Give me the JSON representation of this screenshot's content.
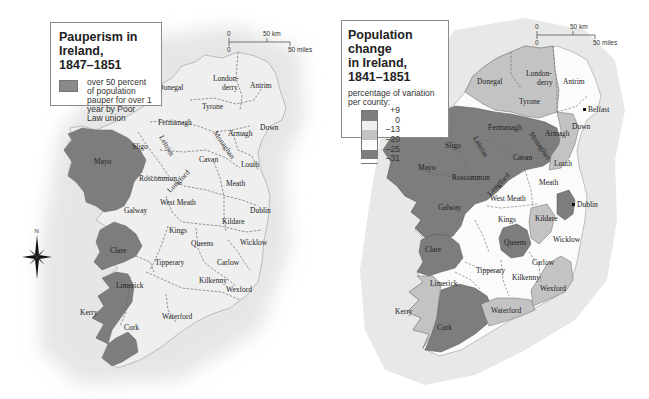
{
  "colors": {
    "sea_halo": "#e9e9e9",
    "land_light": "#efefef",
    "land_white": "#fbfbfb",
    "dark": "#7d7d7d",
    "medium": "#c3c3c3",
    "border": "#6a6a6a"
  },
  "left_map": {
    "legend": {
      "title_line1": "Pauperism in Ireland,",
      "title_line2": "1847–1851",
      "swatch_color": "#8a8a8a",
      "item_text": "over 50 percent of population pauper for over 1 year by Poor Law union"
    },
    "scale": {
      "km_zero": "0",
      "km_label": "50 km",
      "mi_zero": "0",
      "mi_label": "50 miles"
    },
    "compass": {
      "north_label": "N"
    },
    "counties": [
      "Donegal",
      "London-",
      "derry",
      "Antrim",
      "Tyrone",
      "Fermanagh",
      "Down",
      "Armagh",
      "Monaghan",
      "Leitrim",
      "Sligo",
      "Mayo",
      "Cavan",
      "Louth",
      "Roscommon",
      "Longford",
      "Meath",
      "West Meath",
      "Dublin",
      "Galway",
      "Kildare",
      "Kings",
      "Queens",
      "Wicklow",
      "Clare",
      "Tipperary",
      "Carlow",
      "Kilkenny",
      "Limerick",
      "Wexford",
      "Kerry",
      "Waterford",
      "Cork"
    ]
  },
  "right_map": {
    "legend": {
      "title_line1": "Population change",
      "title_line2": "in Ireland, 1841–1851",
      "subtitle": "percentage of variation per county:",
      "scale_labels": [
        "+9",
        "0",
        "–13",
        "–20",
        "–25",
        "–31"
      ],
      "scale_colors": [
        "#7d7d7d",
        "#efefef",
        "#c3c3c3",
        "#fbfbfb",
        "#7d7d7d"
      ]
    },
    "scale": {
      "km_zero": "0",
      "km_label": "50 km",
      "mi_zero": "0",
      "mi_label": "50 miles"
    },
    "cities": [
      "Belfast",
      "Dublin"
    ],
    "county_classes": {
      "dark": [
        "Fermanagh",
        "Monaghan",
        "Cavan",
        "Leitrim",
        "Sligo",
        "Mayo",
        "Roscommon",
        "Longford",
        "Galway",
        "Clare",
        "Cork",
        "Queens",
        "Dublin"
      ],
      "medium": [
        "Donegal",
        "Londonderry",
        "Tyrone",
        "Armagh",
        "Louth",
        "Kildare",
        "Kerry",
        "Waterford",
        "Wexford"
      ],
      "light": [
        "Antrim",
        "Down",
        "Meath",
        "West Meath",
        "Kings",
        "Tipperary",
        "Kilkenny",
        "Carlow",
        "Wicklow",
        "Limerick"
      ]
    }
  }
}
